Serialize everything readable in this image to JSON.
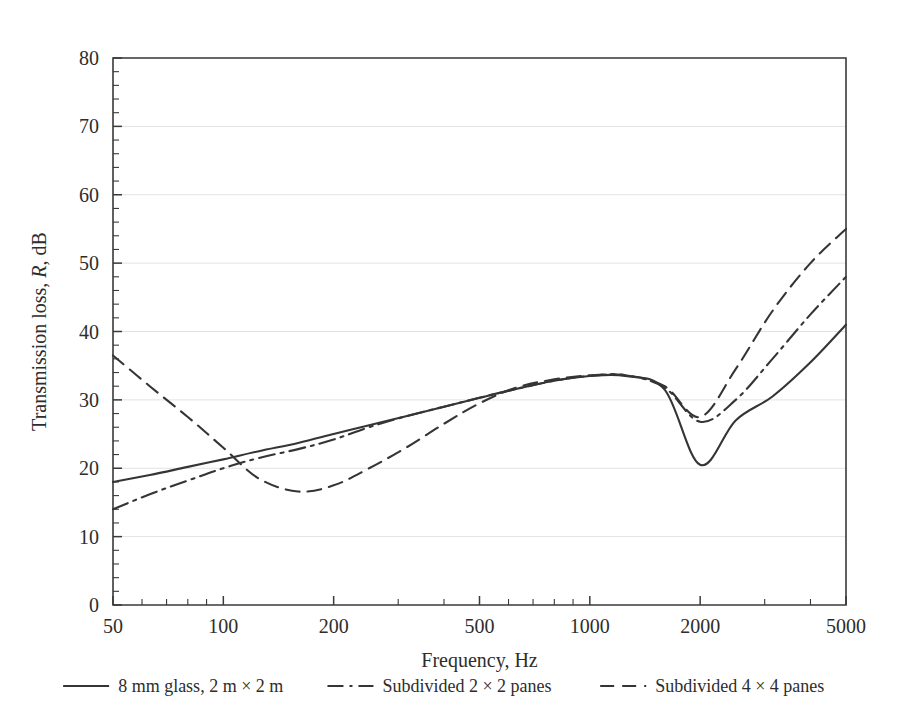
{
  "chart_data": {
    "type": "line",
    "title": "",
    "xlabel": "Frequency, Hz",
    "ylabel": "Transmission loss, R, dB",
    "ylabel_parts": {
      "pre": "Transmission loss, ",
      "italic": "R",
      "post": ", dB"
    },
    "xscale": "log",
    "xlim": [
      50,
      5000
    ],
    "ylim": [
      0,
      80
    ],
    "xticks": [
      50,
      100,
      200,
      500,
      1000,
      2000,
      5000
    ],
    "xtick_labels": [
      "50",
      "100",
      "200",
      "500",
      "1000",
      "2000",
      "5000"
    ],
    "yticks": [
      0,
      10,
      20,
      30,
      40,
      50,
      60,
      70,
      80
    ],
    "ytick_labels": [
      "0",
      "10",
      "20",
      "30",
      "40",
      "50",
      "60",
      "70",
      "80"
    ],
    "grid": "horizontal-major-light",
    "legend_position": "below-figure",
    "series": [
      {
        "name": "8 mm glass, 2 m × 2 m",
        "style": "solid",
        "dasharray": "",
        "x": [
          50,
          63,
          80,
          100,
          125,
          160,
          200,
          250,
          315,
          400,
          500,
          630,
          800,
          1000,
          1250,
          1600,
          2000,
          2500,
          3150,
          4000,
          5000
        ],
        "y": [
          18.0,
          19.0,
          20.2,
          21.3,
          22.5,
          23.7,
          25.0,
          26.3,
          27.6,
          29.0,
          30.3,
          31.6,
          32.8,
          33.5,
          33.5,
          31.5,
          20.5,
          27.0,
          30.5,
          35.5,
          41.0
        ]
      },
      {
        "name": "Subdivided 2 × 2 panes",
        "style": "dash-dot",
        "dasharray": "16 6 3 6",
        "x": [
          50,
          63,
          80,
          100,
          125,
          160,
          200,
          250,
          315,
          400,
          500,
          630,
          800,
          1000,
          1250,
          1600,
          2000,
          2500,
          3150,
          4000,
          5000
        ],
        "y": [
          14.0,
          16.2,
          18.2,
          20.0,
          21.5,
          22.8,
          24.2,
          26.0,
          27.6,
          29.0,
          30.3,
          31.6,
          32.8,
          33.5,
          33.6,
          31.8,
          26.8,
          30.0,
          36.0,
          42.5,
          48.0
        ]
      },
      {
        "name": "Subdivided 4 × 4 panes",
        "style": "dashed",
        "dasharray": "14 8",
        "x": [
          50,
          63,
          80,
          100,
          125,
          160,
          200,
          250,
          315,
          400,
          500,
          630,
          800,
          1000,
          1250,
          1600,
          2000,
          2500,
          3150,
          4000,
          5000
        ],
        "y": [
          36.5,
          32.0,
          27.5,
          23.0,
          18.5,
          16.6,
          17.5,
          20.0,
          23.0,
          26.5,
          29.5,
          31.8,
          33.0,
          33.6,
          33.6,
          32.0,
          27.5,
          34.5,
          43.0,
          50.0,
          55.0
        ]
      }
    ],
    "legend": [
      {
        "label": "8 mm glass, 2 m × 2 m",
        "style": "solid"
      },
      {
        "label": "Subdivided 2 × 2 panes",
        "style": "dash-dot"
      },
      {
        "label": "Subdivided 4 × 4 panes",
        "style": "dashed"
      }
    ],
    "colors": {
      "line": "#353535",
      "axis": "#3a3a3a",
      "grid": "#e2e2e6",
      "background": "#ffffff",
      "text": "#2d2d2d"
    }
  }
}
